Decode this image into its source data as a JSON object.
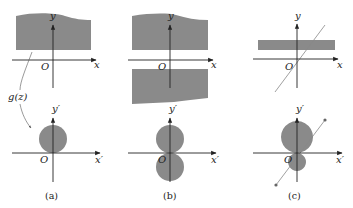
{
  "figure": {
    "colors": {
      "fill": "#8a8a8a",
      "axis": "#222222",
      "line": "#888888",
      "background": "#ffffff"
    },
    "mapping_label": "g(z)",
    "panels": [
      {
        "id": "a",
        "caption": "(a)",
        "z_plane": {
          "x_label": "x",
          "y_label": "y",
          "origin_label": "O",
          "region": "half-plane strip above x-axis (wavy top)"
        },
        "w_plane": {
          "x_label": "x′",
          "y_label": "y′",
          "origin_label": "O",
          "region": "disk tangent to x′-axis at origin, above"
        }
      },
      {
        "id": "b",
        "caption": "(b)",
        "z_plane": {
          "x_label": "x",
          "y_label": "y",
          "origin_label": "O",
          "region": "two regions: above and below x-axis"
        },
        "w_plane": {
          "x_label": "x′",
          "y_label": "y′",
          "origin_label": "O",
          "region": "two disks tangent at origin, above and below"
        }
      },
      {
        "id": "c",
        "caption": "(c)",
        "z_plane": {
          "x_label": "x",
          "y_label": "y",
          "origin_label": "O",
          "region": "horizontal strip above x-axis with diagonal line through origin"
        },
        "w_plane": {
          "x_label": "x′",
          "y_label": "y′",
          "origin_label": "O",
          "region": "crescent between two tangent circles, diagonal line with endpoints"
        }
      }
    ]
  }
}
